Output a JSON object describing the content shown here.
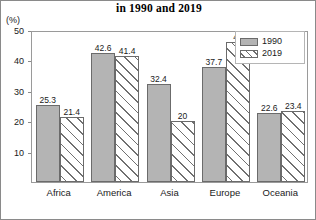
{
  "chart_data": {
    "type": "bar",
    "title": "in 1990 and 2019",
    "xlabel": "",
    "ylabel": "(%)",
    "ylim": [
      0,
      50
    ],
    "yticks": [
      10,
      20,
      30,
      40,
      50
    ],
    "grid": false,
    "legend_position": "top-right",
    "categories": [
      "Africa",
      "America",
      "Asia",
      "Europe",
      "Oceania"
    ],
    "series": [
      {
        "name": "1990",
        "values": [
          25.3,
          42.6,
          32.4,
          37.7,
          22.6
        ],
        "value_labels": [
          "25.3",
          "42.6",
          "32.4",
          "37.7",
          "22.6"
        ],
        "fill": "#b4b4b4",
        "pattern": "solid"
      },
      {
        "name": "2019",
        "values": [
          21.4,
          41.4,
          20,
          46,
          23.4
        ],
        "value_labels": [
          "21.4",
          "41.4",
          "20",
          "46",
          "23.4"
        ],
        "fill": "#efefef",
        "pattern": "diagonal-hatch"
      }
    ]
  },
  "legend": {
    "entries": [
      {
        "label": "1990"
      },
      {
        "label": "2019"
      }
    ]
  },
  "axis": {
    "unit": "(%)",
    "tick_labels": [
      "10",
      "20",
      "30",
      "40",
      "50"
    ]
  }
}
